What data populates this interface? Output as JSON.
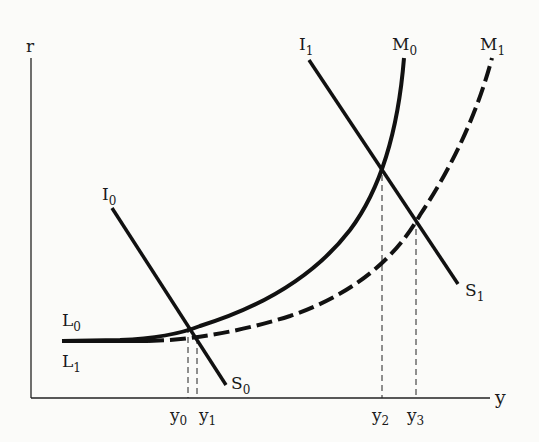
{
  "axes": {
    "y_label": "r",
    "x_label": "y"
  },
  "curves": {
    "I0": {
      "label": "I",
      "sub": "0"
    },
    "I1": {
      "label": "I",
      "sub": "1"
    },
    "M0": {
      "label": "M",
      "sub": "0"
    },
    "M1": {
      "label": "M",
      "sub": "1"
    },
    "S0": {
      "label": "S",
      "sub": "0"
    },
    "S1": {
      "label": "S",
      "sub": "1"
    },
    "L0": {
      "label": "L",
      "sub": "0"
    },
    "L1": {
      "label": "L",
      "sub": "1"
    }
  },
  "ticks": [
    {
      "label": "y",
      "sub": "0"
    },
    {
      "label": "y",
      "sub": "1"
    },
    {
      "label": "y",
      "sub": "2"
    },
    {
      "label": "y",
      "sub": "3"
    }
  ],
  "colors": {
    "ink": "#111111",
    "background": "#fbfbf9"
  }
}
